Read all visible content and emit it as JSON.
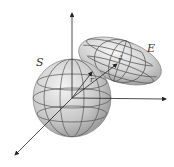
{
  "diagram": {
    "labels": {
      "sphere": "S",
      "ellipsoid": "E",
      "vector_r": "r",
      "vector_r_tilde": "r̃"
    },
    "colors": {
      "axis": "#222222",
      "grid": "#555555",
      "shade_light": "#f2f2f2",
      "shade_dark": "#8f8f8f"
    }
  }
}
